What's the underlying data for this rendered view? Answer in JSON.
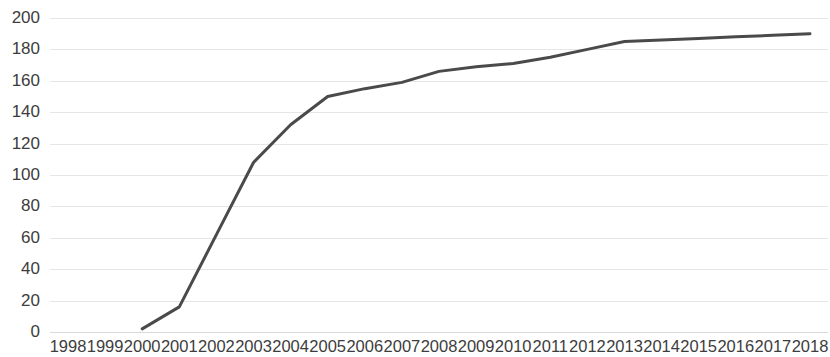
{
  "chart_data": {
    "type": "line",
    "title": "",
    "subtitle": "",
    "xlabel": "",
    "ylabel": "",
    "grid": true,
    "legend": false,
    "legend_position": "none",
    "line_color": "#4a4a4a",
    "line_width": 3,
    "gridline_color": "#e6e6e6",
    "background_color": "#ffffff",
    "xlim": [
      1998,
      2018
    ],
    "ylim": [
      0,
      200
    ],
    "x_tick_labels": [
      "1998",
      "1999",
      "2000",
      "2001",
      "2002",
      "2003",
      "2004",
      "2005",
      "2006",
      "2007",
      "2008",
      "2009",
      "2010",
      "2011",
      "2012",
      "2013",
      "2014",
      "2015",
      "2016",
      "2017",
      "2018"
    ],
    "y_tick_labels": [
      "0",
      "20",
      "40",
      "60",
      "80",
      "100",
      "120",
      "140",
      "160",
      "180",
      "200"
    ],
    "y_ticks": [
      0,
      20,
      40,
      60,
      80,
      100,
      120,
      140,
      160,
      180,
      200
    ],
    "x": [
      2000,
      2001,
      2002,
      2003,
      2004,
      2005,
      2006,
      2007,
      2008,
      2009,
      2010,
      2011,
      2012,
      2013,
      2014,
      2015,
      2016,
      2017,
      2018
    ],
    "series": [
      {
        "name": "series-1",
        "color": "#4a4a4a",
        "values": [
          2,
          16,
          62,
          108,
          132,
          150,
          155,
          159,
          166,
          169,
          171,
          175,
          180,
          185,
          186,
          187,
          188,
          189,
          190
        ]
      }
    ]
  }
}
